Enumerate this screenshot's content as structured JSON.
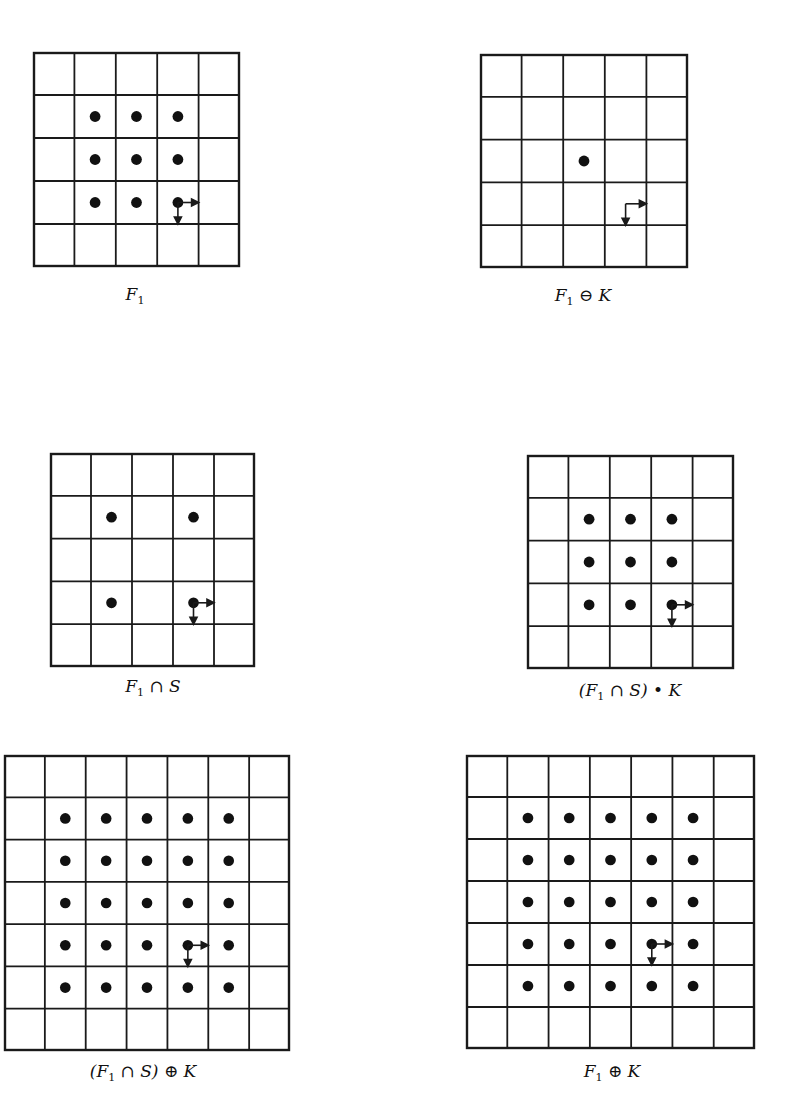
{
  "figure": {
    "colors": {
      "line": "#1a1a1a",
      "dot": "#111111",
      "background": "#ffffff"
    },
    "panels": [
      {
        "id": "F1",
        "caption_parts": [
          "F",
          "1",
          "",
          ""
        ],
        "caption_text": "F1",
        "box": {
          "x": 33,
          "y": 52,
          "w": 207,
          "h": 215
        },
        "rows": 5,
        "cols": 5,
        "dots": [
          [
            1,
            1
          ],
          [
            1,
            2
          ],
          [
            1,
            3
          ],
          [
            2,
            1
          ],
          [
            2,
            2
          ],
          [
            2,
            3
          ],
          [
            3,
            1
          ],
          [
            3,
            2
          ],
          [
            3,
            3
          ]
        ],
        "origin": {
          "row": 3,
          "col": 3,
          "mode": "center"
        },
        "caption_pos": {
          "x": 135,
          "y": 284
        }
      },
      {
        "id": "F1-erosion-K",
        "caption_text": "F1 ⊖ K",
        "box": {
          "x": 480,
          "y": 54,
          "w": 208,
          "h": 214
        },
        "rows": 5,
        "cols": 5,
        "dots": [
          [
            2,
            2
          ]
        ],
        "origin": {
          "row": 3,
          "col": 3,
          "mode": "center"
        },
        "caption_pos": {
          "x": 583,
          "y": 285
        }
      },
      {
        "id": "F1-intersect-S",
        "caption_text": "F1 ∩ S",
        "box": {
          "x": 50,
          "y": 453,
          "w": 205,
          "h": 214
        },
        "rows": 5,
        "cols": 5,
        "dots": [
          [
            1,
            1
          ],
          [
            1,
            3
          ],
          [
            3,
            1
          ],
          [
            3,
            3
          ]
        ],
        "origin": {
          "row": 3,
          "col": 3,
          "mode": "center"
        },
        "caption_pos": {
          "x": 153,
          "y": 676
        }
      },
      {
        "id": "F1-intersect-S-closing-K",
        "caption_text": "(F1 ∩ S) • K",
        "box": {
          "x": 527,
          "y": 455,
          "w": 207,
          "h": 214
        },
        "rows": 5,
        "cols": 5,
        "dots": [
          [
            1,
            1
          ],
          [
            1,
            2
          ],
          [
            1,
            3
          ],
          [
            2,
            1
          ],
          [
            2,
            2
          ],
          [
            2,
            3
          ],
          [
            3,
            1
          ],
          [
            3,
            2
          ],
          [
            3,
            3
          ]
        ],
        "origin": {
          "row": 3,
          "col": 3,
          "mode": "center"
        },
        "caption_pos": {
          "x": 630,
          "y": 680
        }
      },
      {
        "id": "F1-intersect-S-dilation-K",
        "caption_text": "(F1 ∩ S) ⊕ K",
        "box": {
          "x": 4,
          "y": 755,
          "w": 286,
          "h": 296
        },
        "rows": 7,
        "cols": 7,
        "dots": [
          [
            1,
            1
          ],
          [
            1,
            2
          ],
          [
            1,
            3
          ],
          [
            1,
            4
          ],
          [
            1,
            5
          ],
          [
            2,
            1
          ],
          [
            2,
            2
          ],
          [
            2,
            3
          ],
          [
            2,
            4
          ],
          [
            2,
            5
          ],
          [
            3,
            1
          ],
          [
            3,
            2
          ],
          [
            3,
            3
          ],
          [
            3,
            4
          ],
          [
            3,
            5
          ],
          [
            4,
            1
          ],
          [
            4,
            2
          ],
          [
            4,
            3
          ],
          [
            4,
            4
          ],
          [
            4,
            5
          ],
          [
            5,
            1
          ],
          [
            5,
            2
          ],
          [
            5,
            3
          ],
          [
            5,
            4
          ],
          [
            5,
            5
          ]
        ],
        "origin": {
          "row": 4,
          "col": 4,
          "mode": "center"
        },
        "caption_pos": {
          "x": 143,
          "y": 1061
        }
      },
      {
        "id": "F1-dilation-K",
        "caption_text": "F1 ⊕ K",
        "box": {
          "x": 466,
          "y": 755,
          "w": 289,
          "h": 294
        },
        "rows": 7,
        "cols": 7,
        "dots": [
          [
            1,
            1
          ],
          [
            1,
            2
          ],
          [
            1,
            3
          ],
          [
            1,
            4
          ],
          [
            1,
            5
          ],
          [
            2,
            1
          ],
          [
            2,
            2
          ],
          [
            2,
            3
          ],
          [
            2,
            4
          ],
          [
            2,
            5
          ],
          [
            3,
            1
          ],
          [
            3,
            2
          ],
          [
            3,
            3
          ],
          [
            3,
            4
          ],
          [
            3,
            5
          ],
          [
            4,
            1
          ],
          [
            4,
            2
          ],
          [
            4,
            3
          ],
          [
            4,
            4
          ],
          [
            4,
            5
          ],
          [
            5,
            1
          ],
          [
            5,
            2
          ],
          [
            5,
            3
          ],
          [
            5,
            4
          ],
          [
            5,
            5
          ]
        ],
        "origin": {
          "row": 4,
          "col": 4,
          "mode": "center"
        },
        "caption_pos": {
          "x": 612,
          "y": 1061
        }
      }
    ],
    "captions": {
      "F1": {
        "base": "F",
        "sub": "1",
        "rest": ""
      },
      "F1-erosion-K": {
        "base": "F",
        "sub": "1",
        "rest": " ⊖ K"
      },
      "F1-intersect-S": {
        "base": "F",
        "sub": "1",
        "rest": " ∩ S"
      },
      "F1-intersect-S-closing-K": {
        "pre": "(",
        "base": "F",
        "sub": "1",
        "rest": " ∩ S) • K"
      },
      "F1-intersect-S-dilation-K": {
        "pre": "(",
        "base": "F",
        "sub": "1",
        "rest": " ∩ S) ⊕ K"
      },
      "F1-dilation-K": {
        "base": "F",
        "sub": "1",
        "rest": " ⊕ K"
      }
    }
  }
}
